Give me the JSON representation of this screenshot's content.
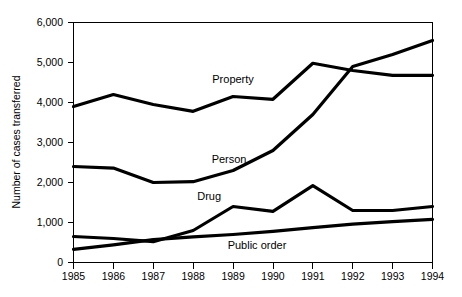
{
  "chart_data": {
    "type": "line",
    "title": "",
    "xlabel": "",
    "ylabel": "Number of cases transferred",
    "categories": [
      "1985",
      "1986",
      "1987",
      "1988",
      "1989",
      "1990",
      "1991",
      "1992",
      "1993",
      "1994"
    ],
    "x": [
      1985,
      1986,
      1987,
      1988,
      1989,
      1990,
      1991,
      1992,
      1993,
      1994
    ],
    "xlim": [
      1985,
      1994
    ],
    "ylim": [
      0,
      6000
    ],
    "yticks": [
      0,
      1000,
      2000,
      3000,
      4000,
      5000,
      6000
    ],
    "ytick_labels": [
      "0",
      "1,000",
      "2,000",
      "3,000",
      "4,000",
      "5,000",
      "6,000"
    ],
    "xtick_labels": [
      "1985",
      "1986",
      "1987",
      "1988",
      "1989",
      "1990",
      "1991",
      "1992",
      "1993",
      "1994"
    ],
    "grid": false,
    "legend_position": "inline-labels",
    "series": [
      {
        "name": "Property",
        "label": "Property",
        "color": "#000000",
        "values": [
          3900,
          4200,
          3950,
          3780,
          4150,
          4080,
          4980,
          4800,
          4680,
          4680
        ]
      },
      {
        "name": "Person",
        "label": "Person",
        "color": "#000000",
        "values": [
          2400,
          2360,
          2000,
          2020,
          2300,
          2800,
          3700,
          4900,
          5200,
          5550
        ]
      },
      {
        "name": "Drug",
        "label": "Drug",
        "color": "#000000",
        "values": [
          650,
          600,
          520,
          800,
          1400,
          1280,
          1920,
          1300,
          1300,
          1400
        ]
      },
      {
        "name": "Public order",
        "label": "Public order",
        "color": "#000000",
        "values": [
          330,
          440,
          570,
          640,
          700,
          780,
          870,
          960,
          1020,
          1080
        ]
      }
    ],
    "annotations": [
      {
        "text": "Property",
        "x": 1989.0,
        "y": 4480
      },
      {
        "text": "Person",
        "x": 1988.9,
        "y": 2480
      },
      {
        "text": "Drug",
        "x": 1988.4,
        "y": 1560
      },
      {
        "text": "Public order",
        "x": 1989.6,
        "y": 330
      }
    ]
  },
  "axes": {
    "y_title": "Number of cases transferred"
  }
}
